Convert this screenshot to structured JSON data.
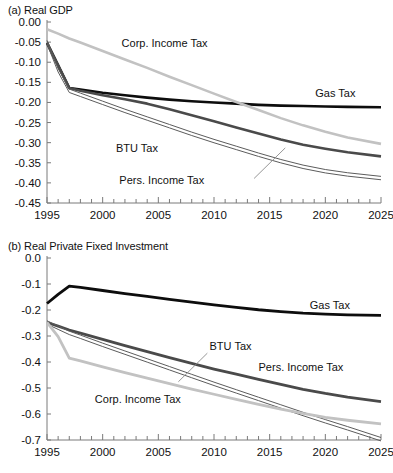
{
  "figure": {
    "panels": [
      {
        "id": "a",
        "title": "(a) Real GDP",
        "chart_data": {
          "type": "line",
          "title": "(a) Real GDP",
          "xlabel": "",
          "ylabel": "",
          "xlim": [
            1995,
            2025
          ],
          "ylim": [
            -0.45,
            0.0
          ],
          "grid": false,
          "legend": "inline-labels",
          "xticks": [
            1995,
            2000,
            2005,
            2010,
            2015,
            2020,
            2025
          ],
          "xtick_labels": [
            "1995",
            "2000",
            "2005",
            "2010",
            "2015",
            "2020",
            "2025"
          ],
          "xminor_step": 1,
          "yticks": [
            0.0,
            -0.05,
            -0.1,
            -0.15,
            -0.2,
            -0.25,
            -0.3,
            -0.35,
            -0.4,
            -0.45
          ],
          "ytick_labels": [
            "0.00",
            "-0.05",
            "-0.10",
            "-0.15",
            "-0.20",
            "-0.25",
            "-0.30",
            "-0.35",
            "-0.40",
            "-0.45"
          ],
          "x": [
            1995,
            1996,
            1997,
            1998,
            2000,
            2002,
            2004,
            2006,
            2008,
            2010,
            2012,
            2014,
            2016,
            2018,
            2020,
            2022,
            2025
          ],
          "series": [
            {
              "name": "Gas Tax",
              "color": "#0d0d0d",
              "width": 2.6,
              "style": "solid",
              "values": [
                -0.052,
                -0.108,
                -0.164,
                -0.168,
                -0.176,
                -0.182,
                -0.188,
                -0.193,
                -0.197,
                -0.2,
                -0.203,
                -0.206,
                -0.208,
                -0.209,
                -0.21,
                -0.211,
                -0.212
              ],
              "label": {
                "text": "Gas Tax",
                "x": 2019.1,
                "y": -0.186,
                "anchor": "start"
              }
            },
            {
              "name": "BTU Tax",
              "color": "#4a4a4a",
              "width": 2.6,
              "style": "solid",
              "values": [
                -0.052,
                -0.108,
                -0.164,
                -0.171,
                -0.182,
                -0.192,
                -0.203,
                -0.217,
                -0.232,
                -0.247,
                -0.262,
                -0.277,
                -0.292,
                -0.305,
                -0.315,
                -0.324,
                -0.334
              ],
              "label": {
                "text": "BTU Tax",
                "x": 2001.2,
                "y": -0.322,
                "anchor": "start"
              }
            },
            {
              "name": "Pers. Income Tax",
              "color": "#5c5c5c",
              "width": 1.0,
              "style": "double",
              "values": [
                -0.05,
                -0.12,
                -0.171,
                -0.181,
                -0.201,
                -0.221,
                -0.24,
                -0.259,
                -0.278,
                -0.296,
                -0.313,
                -0.33,
                -0.346,
                -0.36,
                -0.371,
                -0.379,
                -0.388
              ],
              "label": {
                "text": "Pers. Income Tax",
                "x": 2001.5,
                "y": -0.404,
                "anchor": "start"
              },
              "leader": {
                "x1": 2013.6,
                "y1": -0.389,
                "x2": 2016.4,
                "y2": -0.313
              }
            },
            {
              "name": "Corp. Income Tax",
              "color": "#c2c2c2",
              "width": 2.6,
              "style": "solid",
              "values": [
                -0.018,
                -0.029,
                -0.041,
                -0.051,
                -0.072,
                -0.093,
                -0.114,
                -0.136,
                -0.157,
                -0.178,
                -0.199,
                -0.219,
                -0.239,
                -0.257,
                -0.273,
                -0.287,
                -0.303
              ],
              "label": {
                "text": "Corp. Income Tax",
                "x": 2001.7,
                "y": -0.062,
                "anchor": "start"
              }
            }
          ]
        }
      },
      {
        "id": "b",
        "title": "(b) Real Private Fixed Investment",
        "chart_data": {
          "type": "line",
          "title": "(b) Real Private Fixed Investment",
          "xlabel": "",
          "ylabel": "",
          "xlim": [
            1995,
            2025
          ],
          "ylim": [
            -0.7,
            0.0
          ],
          "grid": false,
          "legend": "inline-labels",
          "xticks": [
            1995,
            2000,
            2005,
            2010,
            2015,
            2020,
            2025
          ],
          "xtick_labels": [
            "1995",
            "2000",
            "2005",
            "2010",
            "2015",
            "2020",
            "2025"
          ],
          "xminor_step": 1,
          "yticks": [
            0.0,
            -0.1,
            -0.2,
            -0.3,
            -0.4,
            -0.5,
            -0.6,
            -0.7
          ],
          "ytick_labels": [
            "0.0",
            "-0.1",
            "-0.2",
            "-0.3",
            "-0.4",
            "-0.5",
            "-0.6",
            "-0.7"
          ],
          "x": [
            1995,
            1996,
            1997,
            1998,
            2000,
            2002,
            2004,
            2006,
            2008,
            2010,
            2012,
            2014,
            2016,
            2018,
            2020,
            2022,
            2025
          ],
          "series": [
            {
              "name": "Gas Tax",
              "color": "#0d0d0d",
              "width": 2.8,
              "style": "solid",
              "values": [
                -0.175,
                -0.14,
                -0.108,
                -0.113,
                -0.125,
                -0.137,
                -0.148,
                -0.159,
                -0.17,
                -0.18,
                -0.19,
                -0.199,
                -0.206,
                -0.212,
                -0.216,
                -0.219,
                -0.221
              ],
              "label": {
                "text": "Gas Tax",
                "x": 2018.6,
                "y": -0.196,
                "anchor": "start"
              }
            },
            {
              "name": "Pers. Income Tax",
              "color": "#4a4a4a",
              "width": 2.8,
              "style": "solid",
              "values": [
                -0.248,
                -0.262,
                -0.277,
                -0.289,
                -0.313,
                -0.337,
                -0.36,
                -0.383,
                -0.405,
                -0.427,
                -0.447,
                -0.467,
                -0.486,
                -0.505,
                -0.521,
                -0.535,
                -0.552
              ],
              "label": {
                "text": "Pers. Income Tax",
                "x": 2014.0,
                "y": -0.436,
                "anchor": "start"
              }
            },
            {
              "name": "BTU Tax",
              "color": "#5c5c5c",
              "width": 1.0,
              "style": "double",
              "values": [
                -0.248,
                -0.268,
                -0.288,
                -0.303,
                -0.334,
                -0.364,
                -0.394,
                -0.424,
                -0.454,
                -0.484,
                -0.513,
                -0.542,
                -0.571,
                -0.6,
                -0.628,
                -0.655,
                -0.697
              ],
              "label": {
                "text": "BTU Tax",
                "x": 2009.6,
                "y": -0.354,
                "anchor": "start"
              },
              "leader": {
                "x1": 2009.4,
                "y1": -0.366,
                "x2": 2006.8,
                "y2": -0.476
              }
            },
            {
              "name": "Corp. Income Tax",
              "color": "#c2c2c2",
              "width": 2.8,
              "style": "solid",
              "values": [
                -0.248,
                -0.302,
                -0.385,
                -0.396,
                -0.419,
                -0.441,
                -0.462,
                -0.483,
                -0.504,
                -0.524,
                -0.544,
                -0.563,
                -0.581,
                -0.598,
                -0.613,
                -0.624,
                -0.638
              ],
              "label": {
                "text": "Corp. Income Tax",
                "x": 1999.3,
                "y": -0.556,
                "anchor": "start"
              }
            }
          ]
        }
      }
    ]
  }
}
